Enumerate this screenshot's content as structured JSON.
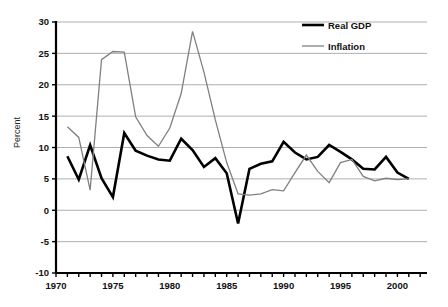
{
  "chart_data": {
    "type": "line",
    "title": "",
    "xlabel": "",
    "ylabel": "Percent",
    "xlim": [
      1970,
      2002.6
    ],
    "ylim": [
      -10,
      30
    ],
    "grid": true,
    "grid_axis": "y",
    "legend_position": "top-right",
    "x_tick_step": 1,
    "x_label_step": 5,
    "y_tick_step": 5,
    "x_tick_labels": [
      "1970",
      "1975",
      "1980",
      "1985",
      "1990",
      "1995",
      "2000"
    ],
    "x_tick_label_values": [
      1970,
      1975,
      1980,
      1985,
      1990,
      1995,
      2000
    ],
    "y_tick_labels": [
      "30",
      "25",
      "20",
      "15",
      "10",
      "5",
      "0",
      "-5",
      "-10"
    ],
    "y_tick_label_values": [
      30,
      25,
      20,
      15,
      10,
      5,
      0,
      -5,
      -10
    ],
    "x": [
      1971,
      1972,
      1973,
      1974,
      1975,
      1976,
      1977,
      1978,
      1979,
      1980,
      1981,
      1982,
      1983,
      1984,
      1985,
      1986,
      1987,
      1988,
      1989,
      1990,
      1991,
      1992,
      1993,
      1994,
      1995,
      1996,
      1997,
      1998,
      1999,
      2000,
      2001
    ],
    "series": [
      {
        "name": "Real GDP",
        "color": "#000000",
        "line_width": 2.6,
        "values": [
          8.6,
          4.9,
          10.4,
          5.1,
          2.1,
          12.3,
          9.5,
          8.7,
          8.1,
          7.9,
          11.4,
          9.6,
          6.9,
          8.3,
          5.9,
          -2.1,
          6.6,
          7.4,
          7.8,
          10.9,
          9.2,
          8.1,
          8.5,
          10.4,
          9.3,
          8.1,
          6.6,
          6.5,
          8.5,
          6.0,
          5.0
        ],
        "values_by_year": {
          "1971": 8.6,
          "1972": 4.9,
          "1973": 10.4,
          "1974": 5.1,
          "1975": 2.1,
          "1976": 12.3,
          "1977": 9.5,
          "1978": 8.7,
          "1979": 8.1,
          "1980": 7.9,
          "1981": 11.4,
          "1982": 9.6,
          "1983": 6.9,
          "1984": 8.3,
          "1985": 5.9,
          "1986": -2.1,
          "1987": 6.6,
          "1988": 7.4,
          "1989": 7.8,
          "1990": 10.9,
          "1991": 9.2,
          "1992": 8.1,
          "1993": 8.5,
          "1994": 10.4,
          "1995": 9.3,
          "1996": 8.1,
          "1997": 6.6,
          "1998": 6.5,
          "1999": 8.5,
          "2000": 6.0,
          "2001": 5.0
        }
      },
      {
        "name": "Inflation",
        "color": "#808080",
        "line_width": 1.3,
        "values": [
          13.3,
          11.6,
          3.2,
          24.0,
          25.3,
          25.2,
          14.9,
          11.9,
          10.2,
          13.1,
          18.6,
          28.5,
          22.0,
          14.4,
          7.6,
          2.6,
          2.4,
          2.6,
          3.3,
          3.1,
          6.0,
          8.8,
          6.2,
          4.4,
          7.6,
          8.1,
          5.4,
          4.7,
          5.1,
          4.9,
          5.0
        ],
        "values_by_year": {
          "1971": 13.3,
          "1972": 11.6,
          "1973": 3.2,
          "1974": 24.0,
          "1975": 25.3,
          "1976": 25.2,
          "1977": 14.9,
          "1978": 11.9,
          "1979": 10.2,
          "1980": 13.1,
          "1981": 18.6,
          "1982": 28.5,
          "1983": 22.0,
          "1984": 14.4,
          "1985": 7.6,
          "1986": 2.6,
          "1987": 2.4,
          "1988": 2.6,
          "1989": 3.3,
          "1990": 3.1,
          "1991": 6.0,
          "1992": 8.8,
          "1993": 6.2,
          "1994": 4.4,
          "1995": 7.6,
          "1996": 8.1,
          "1997": 5.4,
          "1998": 4.7,
          "1999": 5.1,
          "2000": 4.9,
          "2001": 5.0
        }
      }
    ],
    "annotations": [
      {
        "label": "Inflation peak",
        "x": 1982,
        "y": 28.5
      },
      {
        "label": "Inflation secondary peak",
        "x": 1975,
        "y": 25.3
      },
      {
        "label": "Real GDP trough",
        "x": 1986,
        "y": -2.1
      },
      {
        "label": "Real GDP deep trough",
        "x": 1998,
        "y": -7.0
      }
    ]
  },
  "legend": {
    "items": [
      {
        "label": "Real GDP",
        "color": "#000000"
      },
      {
        "label": "Inflation",
        "color": "#808080"
      }
    ]
  },
  "axis": {
    "y_title": "Percent"
  }
}
